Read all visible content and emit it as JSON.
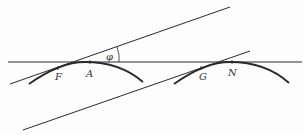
{
  "diagram": {
    "labels": {
      "F": "F",
      "A": "A",
      "phi": "φ",
      "G": "G",
      "N": "N"
    },
    "colors": {
      "stroke": "#2a2a2a",
      "background": "#fdfdfd"
    }
  }
}
